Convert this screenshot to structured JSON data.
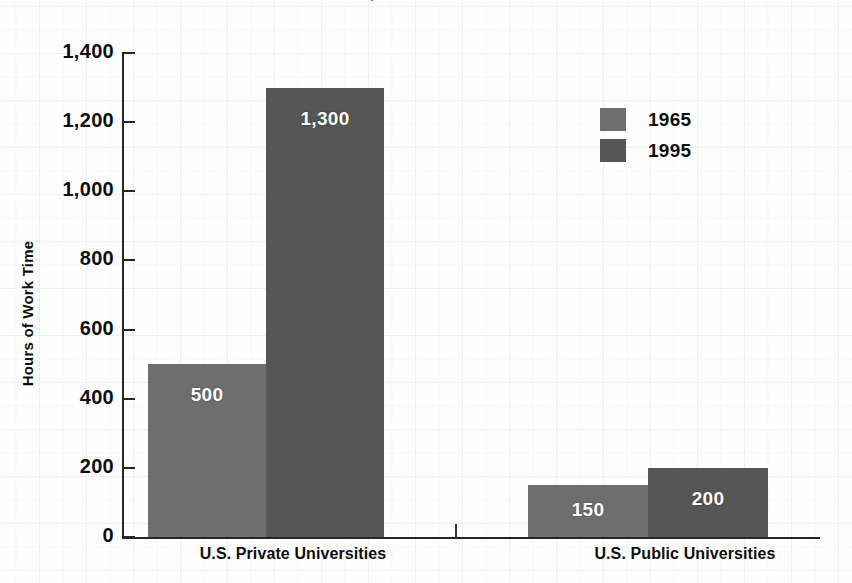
{
  "chart_data": {
    "type": "bar",
    "title": "",
    "xlabel": "",
    "ylabel": "Hours of Work Time",
    "categories": [
      "U.S. Private Universities",
      "U.S. Public Universities"
    ],
    "series": [
      {
        "name": "1965",
        "values": [
          500,
          150
        ],
        "color": "#6e6e6e"
      },
      {
        "name": "1995",
        "values": [
          1300,
          200
        ],
        "color": "#565656"
      }
    ],
    "ylim": [
      0,
      1400
    ],
    "ytick_values": [
      0,
      200,
      400,
      600,
      800,
      1000,
      1200,
      1400
    ],
    "ytick_labels": [
      "0",
      "200",
      "400",
      "600",
      "800",
      "1,000",
      "1,200",
      "1,400"
    ],
    "data_labels": [
      [
        "500",
        "1,300"
      ],
      [
        "150",
        "200"
      ]
    ],
    "grid": false,
    "legend_position": "upper right"
  },
  "axis": {
    "y_title": "Hours of Work Time"
  },
  "legend": {
    "entries": [
      {
        "label": "1965",
        "color": "#6e6e6e"
      },
      {
        "label": "1995",
        "color": "#565656"
      }
    ]
  },
  "bars": [
    {
      "name": "private-1965",
      "label": "500",
      "value": 500,
      "color": "#6e6e6e",
      "left": 148,
      "width": 118
    },
    {
      "name": "private-1995",
      "label": "1,300",
      "value": 1300,
      "color": "#565656",
      "left": 266,
      "width": 118
    },
    {
      "name": "public-1965",
      "label": "150",
      "value": 150,
      "color": "#6e6e6e",
      "left": 528,
      "width": 120
    },
    {
      "name": "public-1995",
      "label": "200",
      "value": 200,
      "color": "#565656",
      "left": 648,
      "width": 120
    }
  ],
  "category_labels": [
    {
      "text": "U.S. Private Universities",
      "left": 128,
      "width": 330
    },
    {
      "text": "U.S. Public Universities",
      "left": 520,
      "width": 330
    }
  ],
  "title_sliver": "Cost of a Computer in Hours of Work Time"
}
